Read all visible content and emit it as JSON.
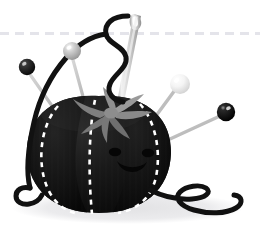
{
  "scene": {
    "title": "Tomato Pincushion Illustration",
    "subject": "tomato-shaped sewing pincushion with pins, needle and thread",
    "canvas": {
      "width": 260,
      "height": 240
    },
    "background_color": "#ffffff"
  },
  "palette": {
    "background": "#ffffff",
    "body_dark": "#141414",
    "body_darker": "#0a0a0a",
    "body_highlight": "#262626",
    "stitch_white": "#ffffff",
    "leaf_gray": "#8a8a8a",
    "leaf_gray_dark": "#6e6e6e",
    "leaf_gray_light": "#9e9e9e",
    "needle_silver": "#c9c9c9",
    "needle_silver_light": "#e8e8e8",
    "needle_shadow": "#a3a3a3",
    "thread_black": "#111111",
    "shadow_gray": "#e9e9ea",
    "dash_line_gray": "#e4e4ea",
    "pin_shaft": "#b9b9b9",
    "pin_dark_head": "#1b1b1b",
    "pin_midgray_head": "#c7c7c7",
    "pin_white_head": "#f2f2f2",
    "pin_black_head": "#0d0d0d"
  },
  "guide_line": {
    "name": "dashed-horizontal-guide",
    "y": 33,
    "x_start": 0,
    "x_end": 260,
    "color": "#e4e4ea",
    "stroke_width": 3,
    "dash_pattern": "9 6"
  },
  "shadow": {
    "name": "ground-shadow",
    "cx": 128,
    "cy": 208,
    "rx": 116,
    "ry": 16,
    "color": "#e9e9ea"
  },
  "pincushion_body": {
    "name": "tomato-body",
    "center_x": 99,
    "center_y": 155,
    "radius_x": 72,
    "radius_y": 60,
    "fill": "#141414",
    "lobes": 3
  },
  "stitch_lines": [
    {
      "name": "stitch-seam-left",
      "dash": "5 5",
      "color": "#ffffff",
      "width": 2.6
    },
    {
      "name": "stitch-seam-center",
      "dash": "5 5",
      "color": "#ffffff",
      "width": 2.6
    },
    {
      "name": "stitch-seam-right",
      "dash": "5 5",
      "color": "#ffffff",
      "width": 2.6
    }
  ],
  "face": {
    "name": "tomato-face",
    "eye_left": {
      "cx": 115,
      "cy": 152,
      "rx": 6,
      "ry": 4
    },
    "eye_right": {
      "cx": 148,
      "cy": 153,
      "rx": 6,
      "ry": 4
    },
    "mouth": {
      "cx": 131,
      "cy": 163,
      "rx": 14,
      "ry": 10
    },
    "color": "#070707"
  },
  "calyx": {
    "name": "tomato-calyx-leaves",
    "center_x": 110,
    "center_y": 112,
    "leaf_count": 6,
    "fill": "#8a8a8a",
    "fill_dark": "#6e6e6e",
    "fill_light": "#9e9e9e"
  },
  "needle": {
    "name": "sewing-needle",
    "tip_x": 116,
    "tip_y": 118,
    "eye_x": 136,
    "eye_y": 16,
    "color": "#c9c9c9",
    "highlight": "#eeeeee",
    "shadow": "#a0a0a0",
    "eye_hole": "#ffffff"
  },
  "thread": {
    "name": "black-thread",
    "color": "#111111",
    "stroke_width": 5,
    "segments": [
      "s-curve-through-needle-eye",
      "loop-around-body-left",
      "tail-curl-bottom-left",
      "loose-curl-bottom-right"
    ]
  },
  "pins": [
    {
      "name": "pin-dark-upper-left",
      "head_cx": 27,
      "head_cy": 67,
      "head_r": 8,
      "head_color": "#1b1b1b",
      "head_highlight": "#8f8f8f",
      "shaft_to_x": 70,
      "shaft_to_y": 130,
      "shaft_color": "#bdbdbd"
    },
    {
      "name": "pin-gray-upper-middle",
      "head_cx": 72,
      "head_cy": 51,
      "head_r": 9,
      "head_color": "#c7c7c7",
      "head_highlight": "#efefef",
      "shaft_to_x": 90,
      "shaft_to_y": 120,
      "shaft_color": "#c4c4c4"
    },
    {
      "name": "pin-white-upper-right",
      "head_cx": 180,
      "head_cy": 84,
      "head_r": 10,
      "head_color": "#f2f2f2",
      "head_highlight": "#ffffff",
      "shaft_to_x": 138,
      "shaft_to_y": 141,
      "shaft_color": "#bbbbbb"
    },
    {
      "name": "pin-black-right",
      "head_cx": 226,
      "head_cy": 112,
      "head_r": 9,
      "head_color": "#0d0d0d",
      "head_highlight": "#a0a0a0",
      "shaft_to_x": 172,
      "shaft_to_y": 138,
      "shaft_color": "#b5b5b5"
    }
  ],
  "alt_text": "Illustration of a dark tomato-shaped pincushion with a smiling face, gray leaf calyx, white dashed stitching, four straight pins with round heads, a silver sewing needle and a curling black thread, resting on a pale gray shadow below a light dashed horizontal guide line."
}
